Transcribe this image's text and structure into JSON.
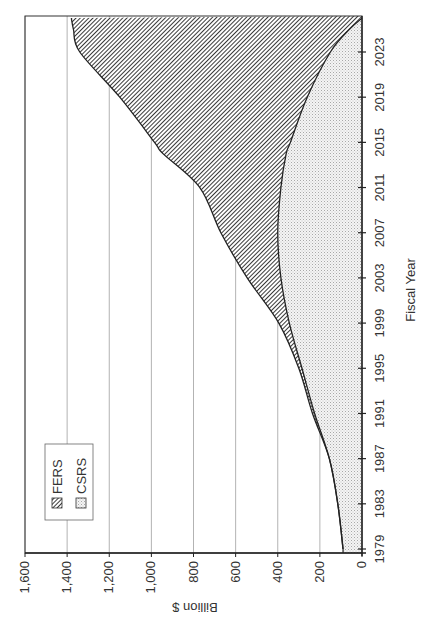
{
  "chart_data": {
    "type": "area",
    "stacked": true,
    "orientation": "rotated-90-ccw",
    "title": "",
    "xlabel": "Fiscal Year",
    "ylabel": "Billion $",
    "x_ticks": [
      "1979",
      "1983",
      "1987",
      "1991",
      "1995",
      "1999",
      "2003",
      "2007",
      "2011",
      "2015",
      "2019",
      "2023"
    ],
    "y_ticks": [
      "0",
      "200",
      "400",
      "600",
      "800",
      "1,000",
      "1,200",
      "1,400",
      "1,600"
    ],
    "ylim": [
      0,
      1600
    ],
    "xlim": [
      1979,
      2026
    ],
    "grid": "major value gridlines",
    "legend": {
      "position": "upper-left (rotated)",
      "entries": [
        {
          "label": "FERS",
          "pattern": "diagonal-hatch",
          "color": "#555555"
        },
        {
          "label": "CSRS",
          "pattern": "light-dots",
          "color": "#d9d9d9"
        }
      ]
    },
    "x": [
      1979,
      1983,
      1987,
      1991,
      1995,
      1999,
      2003,
      2007,
      2011,
      2014,
      2015,
      2019,
      2023,
      2025,
      2026
    ],
    "series": [
      {
        "name": "CSRS",
        "values": [
          90,
          115,
          155,
          225,
          285,
          345,
          385,
          400,
          385,
          360,
          340,
          260,
          150,
          60,
          0
        ]
      },
      {
        "name": "FERS",
        "values": [
          0,
          0,
          0,
          10,
          15,
          50,
          160,
          270,
          385,
          585,
          645,
          890,
          1190,
          1310,
          1380
        ]
      }
    ],
    "totals": [
      90,
      115,
      155,
      235,
      300,
      395,
      545,
      670,
      770,
      945,
      985,
      1150,
      1340,
      1370,
      1380
    ]
  },
  "labels": {
    "xlabel": "Fiscal Year",
    "ylabel": "Billion $",
    "legend_fers": "FERS",
    "legend_csrs": "CSRS"
  }
}
